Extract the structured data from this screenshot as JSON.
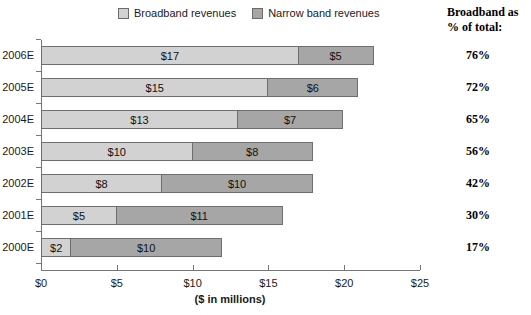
{
  "legend": {
    "items": [
      {
        "label": "Broadband revenues",
        "color": "#d2d2d2",
        "swatch_name": "legend-swatch-broadband"
      },
      {
        "label": "Narrow band revenues",
        "color": "#a6a6a6",
        "swatch_name": "legend-swatch-narrowband"
      }
    ]
  },
  "right_header": {
    "line1": "Broadband as",
    "line2": "% of total:"
  },
  "chart_data": {
    "type": "bar",
    "orientation": "horizontal",
    "stacked": true,
    "title": "",
    "subtitle": "",
    "xlabel": "($ in millions)",
    "ylabel": "",
    "xlim": [
      0,
      25
    ],
    "xticks": [
      0,
      5,
      10,
      15,
      20,
      25
    ],
    "xtick_labels": [
      "$0",
      "$5",
      "$10",
      "$15",
      "$20",
      "$25"
    ],
    "grid": false,
    "legend_position": "top-center",
    "categories": [
      "2006E",
      "2005E",
      "2004E",
      "2003E",
      "2002E",
      "2001E",
      "2000E"
    ],
    "series": [
      {
        "name": "Broadband revenues",
        "color": "#d2d2d2",
        "values": [
          17,
          15,
          13,
          10,
          8,
          5,
          2
        ],
        "data_labels": [
          "$17",
          "$15",
          "$13",
          "$10",
          "$8",
          "$5",
          "$2"
        ]
      },
      {
        "name": "Narrow band revenues",
        "color": "#a6a6a6",
        "values": [
          5,
          6,
          7,
          8,
          10,
          11,
          10
        ],
        "data_labels": [
          "$5",
          "$6",
          "$7",
          "$8",
          "$10",
          "$11",
          "$10"
        ]
      }
    ],
    "totals": [
      22,
      21,
      20,
      18,
      18,
      16,
      12
    ],
    "annotations": {
      "broadband_pct_of_total": [
        "76%",
        "72%",
        "65%",
        "56%",
        "42%",
        "30%",
        "17%"
      ]
    }
  }
}
